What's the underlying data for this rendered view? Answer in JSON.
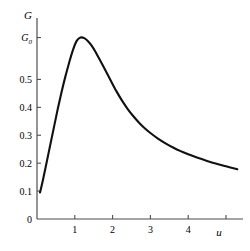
{
  "chart_data": {
    "type": "line",
    "title": "",
    "subtitle": "",
    "xlabel": "u",
    "ylabel": "G",
    "xlim": [
      0,
      5.45
    ],
    "ylim": [
      0,
      0.72
    ],
    "grid": false,
    "legend": null,
    "line_color": "#111111",
    "axis_color": "#4d4d4d",
    "background_color": "#ffffff",
    "x_ticks": [
      {
        "value": 1,
        "label": "1"
      },
      {
        "value": 2,
        "label": "2"
      },
      {
        "value": 3,
        "label": "3"
      },
      {
        "value": 4,
        "label": "4"
      },
      {
        "value": 5,
        "label": ""
      }
    ],
    "y_ticks": [
      {
        "value": 0,
        "label": "0"
      },
      {
        "value": 0.1,
        "label": "0.1"
      },
      {
        "value": 0.2,
        "label": "0.2"
      },
      {
        "value": 0.3,
        "label": "0.3"
      },
      {
        "value": 0.4,
        "label": "0.4"
      },
      {
        "value": 0.5,
        "label": "0.5"
      },
      {
        "value": 0.65,
        "label": "G0",
        "label_base": "G",
        "label_sub": "0"
      }
    ],
    "annotations": [
      {
        "name": "peak",
        "x": 1.15,
        "y": 0.65,
        "text": ""
      }
    ],
    "series": [
      {
        "name": "G(u)",
        "x": [
          0.08,
          0.15,
          0.25,
          0.35,
          0.45,
          0.55,
          0.65,
          0.75,
          0.85,
          0.95,
          1.05,
          1.15,
          1.25,
          1.35,
          1.45,
          1.55,
          1.65,
          1.75,
          1.85,
          1.95,
          2.1,
          2.25,
          2.4,
          2.55,
          2.7,
          2.85,
          3.0,
          3.2,
          3.4,
          3.6,
          3.8,
          4.0,
          4.25,
          4.5,
          4.75,
          5.0,
          5.25,
          5.3
        ],
        "y": [
          0.095,
          0.135,
          0.2,
          0.265,
          0.33,
          0.395,
          0.455,
          0.51,
          0.56,
          0.605,
          0.638,
          0.65,
          0.648,
          0.637,
          0.62,
          0.598,
          0.573,
          0.548,
          0.522,
          0.496,
          0.458,
          0.424,
          0.394,
          0.368,
          0.345,
          0.325,
          0.308,
          0.288,
          0.271,
          0.256,
          0.243,
          0.232,
          0.219,
          0.208,
          0.198,
          0.189,
          0.18,
          0.178
        ]
      }
    ]
  },
  "axes": {
    "y_axis_title": "G",
    "x_axis_title": "u"
  }
}
